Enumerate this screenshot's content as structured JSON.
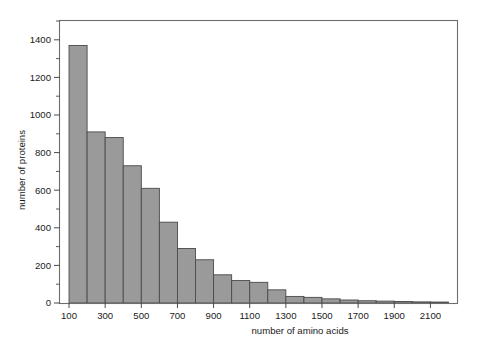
{
  "chart_data": {
    "type": "bar",
    "title": "",
    "subtitle": "",
    "xlabel": "number of amino acids",
    "ylabel": "number of proteins",
    "xlim": [
      50,
      2250
    ],
    "ylim": [
      0,
      1500
    ],
    "grid": false,
    "legend": null,
    "bin_width": 100,
    "bar_fill_color": "#9a9a9a",
    "bar_border_color": "#4a4a4a",
    "frame_color": "#6e6e6e",
    "x_tick_labels": [
      "100",
      "300",
      "500",
      "700",
      "900",
      "1100",
      "1300",
      "1500",
      "1700",
      "1900",
      "2100"
    ],
    "x_tick_values": [
      100,
      300,
      500,
      700,
      900,
      1100,
      1300,
      1500,
      1700,
      1900,
      2100
    ],
    "y_tick_labels": [
      "0",
      "200",
      "400",
      "600",
      "800",
      "1000",
      "1200",
      "1400"
    ],
    "y_tick_values": [
      0,
      200,
      400,
      600,
      800,
      1000,
      1200,
      1400
    ],
    "y_minor_tick_values": [
      100,
      300,
      500,
      700,
      900,
      1100,
      1300,
      1500
    ],
    "bin_starts": [
      100,
      200,
      300,
      400,
      500,
      600,
      700,
      800,
      900,
      1000,
      1100,
      1200,
      1300,
      1400,
      1500,
      1600,
      1700,
      1800,
      1900,
      2000,
      2100
    ],
    "categories": [
      "100-200",
      "200-300",
      "300-400",
      "400-500",
      "500-600",
      "600-700",
      "700-800",
      "800-900",
      "900-1000",
      "1000-1100",
      "1100-1200",
      "1200-1300",
      "1300-1400",
      "1400-1500",
      "1500-1600",
      "1600-1700",
      "1700-1800",
      "1800-1900",
      "1900-2000",
      "2000-2100",
      "2100-2200"
    ],
    "values": [
      1370,
      910,
      880,
      730,
      610,
      430,
      290,
      230,
      150,
      120,
      110,
      70,
      35,
      30,
      22,
      16,
      12,
      10,
      8,
      6,
      5
    ]
  }
}
